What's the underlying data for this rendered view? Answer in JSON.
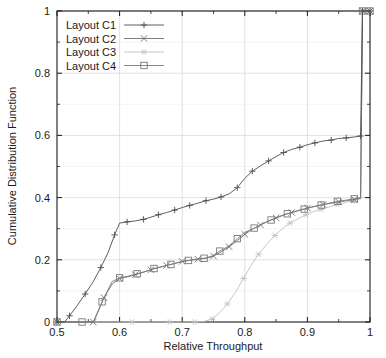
{
  "chart_data": {
    "type": "line",
    "title": "",
    "xlabel": "Relative Throughput",
    "ylabel": "Cumulative Distribution Function",
    "xlim": [
      0.5,
      1.0
    ],
    "ylim": [
      0.0,
      1.0
    ],
    "xticks": [
      0.5,
      0.6,
      0.7,
      0.8,
      0.9,
      1.0
    ],
    "xtick_labels": [
      "0.5",
      "0.6",
      "0.7",
      "0.8",
      "0.9",
      "1"
    ],
    "yticks": [
      0.0,
      0.2,
      0.4,
      0.6,
      0.8,
      1.0
    ],
    "ytick_labels": [
      "0",
      "0.2",
      "0.4",
      "0.6",
      "0.8",
      "1"
    ],
    "minor_ticks": true,
    "grid": true,
    "legend_position": "top-left",
    "series": [
      {
        "name": "Layout C1",
        "marker": "plus",
        "color": "#4d4d4d",
        "points": [
          [
            0.5,
            0.0
          ],
          [
            0.512,
            0.0
          ],
          [
            0.52,
            0.02
          ],
          [
            0.532,
            0.052
          ],
          [
            0.545,
            0.09
          ],
          [
            0.558,
            0.13
          ],
          [
            0.57,
            0.175
          ],
          [
            0.582,
            0.225
          ],
          [
            0.592,
            0.28
          ],
          [
            0.6,
            0.318
          ],
          [
            0.612,
            0.322
          ],
          [
            0.625,
            0.325
          ],
          [
            0.638,
            0.33
          ],
          [
            0.65,
            0.337
          ],
          [
            0.662,
            0.345
          ],
          [
            0.675,
            0.352
          ],
          [
            0.688,
            0.36
          ],
          [
            0.7,
            0.368
          ],
          [
            0.712,
            0.375
          ],
          [
            0.725,
            0.382
          ],
          [
            0.738,
            0.39
          ],
          [
            0.75,
            0.395
          ],
          [
            0.762,
            0.402
          ],
          [
            0.775,
            0.412
          ],
          [
            0.788,
            0.432
          ],
          [
            0.8,
            0.462
          ],
          [
            0.812,
            0.485
          ],
          [
            0.825,
            0.502
          ],
          [
            0.838,
            0.518
          ],
          [
            0.85,
            0.532
          ],
          [
            0.862,
            0.545
          ],
          [
            0.875,
            0.555
          ],
          [
            0.888,
            0.562
          ],
          [
            0.9,
            0.57
          ],
          [
            0.912,
            0.576
          ],
          [
            0.925,
            0.582
          ],
          [
            0.938,
            0.585
          ],
          [
            0.95,
            0.59
          ],
          [
            0.962,
            0.592
          ],
          [
            0.975,
            0.595
          ],
          [
            0.985,
            0.598
          ],
          [
            0.988,
            1.0
          ],
          [
            1.0,
            1.0
          ]
        ]
      },
      {
        "name": "Layout C2",
        "marker": "cross",
        "color": "#6e6e6e",
        "points": [
          [
            0.5,
            0.0
          ],
          [
            0.54,
            0.0
          ],
          [
            0.558,
            0.0
          ],
          [
            0.565,
            0.03
          ],
          [
            0.575,
            0.078
          ],
          [
            0.588,
            0.122
          ],
          [
            0.6,
            0.14
          ],
          [
            0.612,
            0.145
          ],
          [
            0.625,
            0.152
          ],
          [
            0.638,
            0.16
          ],
          [
            0.65,
            0.168
          ],
          [
            0.662,
            0.175
          ],
          [
            0.675,
            0.182
          ],
          [
            0.688,
            0.188
          ],
          [
            0.7,
            0.195
          ],
          [
            0.712,
            0.198
          ],
          [
            0.725,
            0.202
          ],
          [
            0.738,
            0.205
          ],
          [
            0.75,
            0.212
          ],
          [
            0.762,
            0.225
          ],
          [
            0.775,
            0.242
          ],
          [
            0.788,
            0.262
          ],
          [
            0.8,
            0.282
          ],
          [
            0.812,
            0.298
          ],
          [
            0.825,
            0.312
          ],
          [
            0.838,
            0.325
          ],
          [
            0.85,
            0.335
          ],
          [
            0.862,
            0.345
          ],
          [
            0.875,
            0.352
          ],
          [
            0.888,
            0.36
          ],
          [
            0.9,
            0.366
          ],
          [
            0.912,
            0.372
          ],
          [
            0.925,
            0.378
          ],
          [
            0.938,
            0.382
          ],
          [
            0.95,
            0.386
          ],
          [
            0.962,
            0.39
          ],
          [
            0.975,
            0.394
          ],
          [
            0.985,
            0.398
          ],
          [
            0.988,
            1.0
          ],
          [
            1.0,
            1.0
          ]
        ]
      },
      {
        "name": "Layout C3",
        "marker": "star",
        "color": "#c2c2c2",
        "points": [
          [
            0.5,
            0.0
          ],
          [
            0.59,
            0.0
          ],
          [
            0.62,
            0.0
          ],
          [
            0.65,
            0.0
          ],
          [
            0.68,
            0.0
          ],
          [
            0.7,
            0.0
          ],
          [
            0.72,
            0.0
          ],
          [
            0.735,
            0.002
          ],
          [
            0.748,
            0.01
          ],
          [
            0.76,
            0.03
          ],
          [
            0.772,
            0.058
          ],
          [
            0.785,
            0.095
          ],
          [
            0.798,
            0.14
          ],
          [
            0.81,
            0.182
          ],
          [
            0.822,
            0.218
          ],
          [
            0.835,
            0.25
          ],
          [
            0.848,
            0.278
          ],
          [
            0.86,
            0.3
          ],
          [
            0.872,
            0.318
          ],
          [
            0.885,
            0.332
          ],
          [
            0.898,
            0.345
          ],
          [
            0.91,
            0.355
          ],
          [
            0.922,
            0.362
          ],
          [
            0.935,
            0.37
          ],
          [
            0.948,
            0.378
          ],
          [
            0.96,
            0.384
          ],
          [
            0.972,
            0.39
          ],
          [
            0.985,
            0.396
          ],
          [
            0.988,
            1.0
          ],
          [
            1.0,
            1.0
          ]
        ]
      },
      {
        "name": "Layout C4",
        "marker": "square",
        "color": "#7a7a7a",
        "points": [
          [
            0.5,
            0.0
          ],
          [
            0.52,
            0.0
          ],
          [
            0.54,
            0.0
          ],
          [
            0.558,
            0.0
          ],
          [
            0.572,
            0.065
          ],
          [
            0.588,
            0.13
          ],
          [
            0.6,
            0.142
          ],
          [
            0.615,
            0.148
          ],
          [
            0.628,
            0.155
          ],
          [
            0.642,
            0.163
          ],
          [
            0.655,
            0.172
          ],
          [
            0.668,
            0.178
          ],
          [
            0.682,
            0.185
          ],
          [
            0.695,
            0.192
          ],
          [
            0.71,
            0.198
          ],
          [
            0.722,
            0.202
          ],
          [
            0.735,
            0.205
          ],
          [
            0.748,
            0.212
          ],
          [
            0.76,
            0.228
          ],
          [
            0.775,
            0.245
          ],
          [
            0.788,
            0.268
          ],
          [
            0.8,
            0.288
          ],
          [
            0.815,
            0.302
          ],
          [
            0.828,
            0.315
          ],
          [
            0.842,
            0.328
          ],
          [
            0.855,
            0.338
          ],
          [
            0.868,
            0.348
          ],
          [
            0.882,
            0.356
          ],
          [
            0.895,
            0.363
          ],
          [
            0.908,
            0.37
          ],
          [
            0.922,
            0.376
          ],
          [
            0.935,
            0.382
          ],
          [
            0.948,
            0.388
          ],
          [
            0.962,
            0.392
          ],
          [
            0.975,
            0.396
          ],
          [
            0.985,
            0.4
          ],
          [
            0.988,
            1.0
          ],
          [
            1.0,
            1.0
          ]
        ]
      }
    ]
  },
  "legend": {
    "entries": [
      {
        "label": "Layout C1"
      },
      {
        "label": "Layout C2"
      },
      {
        "label": "Layout C3"
      },
      {
        "label": "Layout C4"
      }
    ]
  },
  "axes": {
    "x_title": "Relative Throughput",
    "y_title": "Cumulative Distribution Function"
  },
  "colors": {
    "axis": "#1a1a1a",
    "grid": "#d8d8e2",
    "background": "#ffffff"
  }
}
